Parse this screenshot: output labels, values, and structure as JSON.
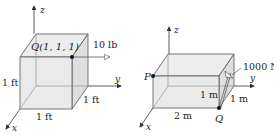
{
  "figures": [
    {
      "name": "cube-figure",
      "axes": {
        "x": "x",
        "y": "y",
        "z": "z"
      },
      "point_label": "Q(1, 1, 1)",
      "force_label": "10 lb",
      "dimensions": {
        "height": "1 ft",
        "width": "1 ft",
        "depth": "1 ft"
      }
    },
    {
      "name": "box-figure",
      "axes": {
        "x": "x",
        "y": "y",
        "z": "z"
      },
      "point_p": "P",
      "point_q": "Q",
      "force_label": "1000 N",
      "dimensions": {
        "length": "2 m",
        "height": "1 m",
        "depth": "1 m"
      }
    }
  ],
  "colors": {
    "face": "#e6e6e6",
    "edge": "#555555",
    "axis": "#333333"
  }
}
